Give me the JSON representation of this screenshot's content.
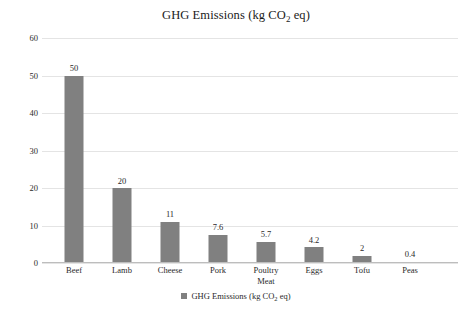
{
  "chart_data": {
    "type": "bar",
    "title": "GHG Emissions (kg CO2 eq)",
    "title_parts": {
      "before": "GHG Emissions (kg CO",
      "sub": "2",
      "after": " eq)"
    },
    "categories": [
      "Beef",
      "Lamb",
      "Cheese",
      "Pork",
      "Poultry Meat",
      "Eggs",
      "Tofu",
      "Peas"
    ],
    "category_lines": [
      [
        "Beef"
      ],
      [
        "Lamb"
      ],
      [
        "Cheese"
      ],
      [
        "Pork"
      ],
      [
        "Poultry",
        "Meat"
      ],
      [
        "Eggs"
      ],
      [
        "Tofu"
      ],
      [
        "Peas"
      ]
    ],
    "values": [
      50,
      20,
      11,
      7.6,
      5.7,
      4.2,
      2,
      0.4
    ],
    "value_labels": [
      "50",
      "20",
      "11",
      "7.6",
      "5.7",
      "4.2",
      "2",
      "0.4"
    ],
    "series": [
      {
        "name": "GHG Emissions (kg CO2 eq)",
        "values": [
          50,
          20,
          11,
          7.6,
          5.7,
          4.2,
          2,
          0.4
        ],
        "color": "#808080"
      }
    ],
    "xlabel": "",
    "ylabel": "",
    "ylim": [
      0,
      60
    ],
    "yticks": [
      0,
      10,
      20,
      30,
      40,
      50,
      60
    ],
    "ytick_labels": [
      "0",
      "10",
      "20",
      "30",
      "40",
      "50",
      "60"
    ],
    "grid": true,
    "grid_axis": "y",
    "grid_color": "#e4e4e4",
    "legend": {
      "position": "bottom",
      "entries": [
        {
          "label": "GHG Emissions (kg CO2 eq)",
          "color": "#808080"
        }
      ],
      "label_parts": {
        "before": "GHG Emissions (kg CO",
        "sub": "2",
        "after": " eq)"
      }
    },
    "data_labels": true,
    "background_color": "#ffffff",
    "axis_line_color": "#bdbdbd",
    "text_color": "#2a2a2a"
  }
}
